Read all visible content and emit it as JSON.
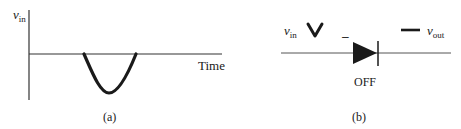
{
  "panel_a": {
    "caption": "(a)",
    "y_axis_label": {
      "symbol": "v",
      "subscript": "in"
    },
    "x_axis_label": "Time",
    "waveform": "single negative half-cycle (inverted hump) below time axis"
  },
  "panel_b": {
    "caption": "(b)",
    "input_label": {
      "symbol": "v",
      "subscript": "in"
    },
    "output_label": {
      "symbol": "v",
      "subscript": "out"
    },
    "input_waveform_icon": "negative-pulse-v-shape",
    "output_waveform_icon": "flat-line-dash",
    "diode_polarity_mark": "–",
    "diode_state": "OFF"
  },
  "colors": {
    "stroke": "#1a1a1a",
    "axis": "#333333",
    "background": "#ffffff"
  }
}
